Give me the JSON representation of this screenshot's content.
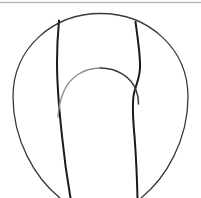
{
  "figure": {
    "description": "Hand-drawn contour sketch of a rounded oval body containing an inner U-shaped form",
    "background_color": "#ffffff",
    "width": 201,
    "height": 198,
    "style": "monochrome line art, no fill, no labels, no text"
  },
  "palette": {
    "ink_dark": "#1a1a1a",
    "ink_mid": "#3a3a3a",
    "ink_light": "#8d8d8d",
    "rule_gray": "#b9b9b9",
    "paper": "#ffffff"
  },
  "strokes": [
    {
      "name": "top-rule-line",
      "role": "faint horizontal page rule near top edge",
      "color": "#b9b9b9",
      "width": 1.6,
      "path": "M 0 2.5 L 201 2.5"
    },
    {
      "name": "outer-oval-contour",
      "role": "large outer ellipse forming the body outline",
      "color": "#3a3a3a",
      "width": 1.3,
      "path": "M 100.5 13.5 C 148 13.5 188 48 188 97 C 188 140 166 178 141 198 M 100.5 13.5 C 53 13.5 13 48 13 97 C 13 140 35 178 60 198"
    },
    {
      "name": "left-inner-contour",
      "role": "left vertical contour running from oval crown down past the bottom edge",
      "color": "#1a1a1a",
      "width": 2.0,
      "path": "M 59 20.5 C 57 42 56.5 62 57.5 82 C 58.5 102 60 118 62 136 C 64 156 67 178 70.5 198"
    },
    {
      "name": "right-inner-contour",
      "role": "right vertical contour with a pronounced waist, running to the bottom edge",
      "color": "#1a1a1a",
      "width": 2.0,
      "path": "M 135.5 22.0 C 138 40 140.5 56 140 68 C 139.5 80 135 86 133.5 96 C 132 108 133 120 134.5 136 C 136 156 137 178 137.5 198"
    },
    {
      "name": "inner-arch-left",
      "role": "left half of the inner U-shaped arch",
      "color": "#8d8d8d",
      "width": 1.4,
      "path": "M 100.5 68 C 84 68 70 77 64 91 C 60 100 58.5 108 58 117"
    },
    {
      "name": "inner-arch-right",
      "role": "right half of the inner U-shaped arch",
      "color": "#3a3a3a",
      "width": 1.5,
      "path": "M 100.5 68 C 117 68 131 77 136 90 C 138 95 138.5 99 138.5 104"
    }
  ],
  "regions": [
    {
      "name": "outer-oval-region",
      "label": "outer oval body"
    },
    {
      "name": "inner-u-region",
      "label": "inner U-shaped form"
    },
    {
      "name": "left-channel-region",
      "label": "left channel between contours"
    },
    {
      "name": "right-channel-region",
      "label": "right channel between contours"
    }
  ]
}
